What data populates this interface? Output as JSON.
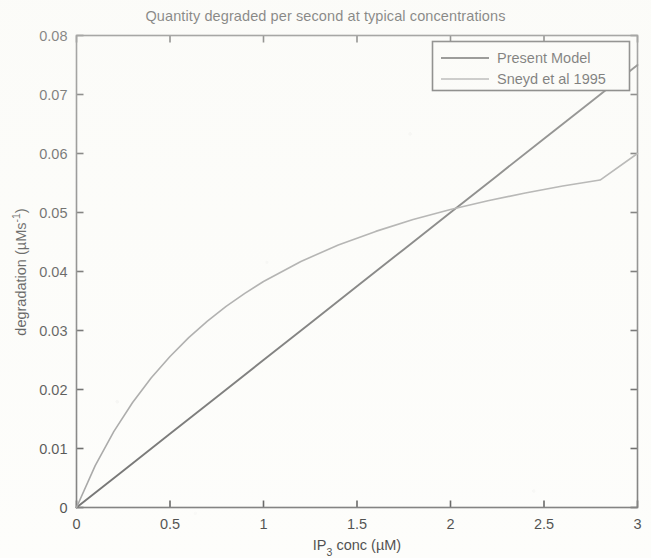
{
  "chart_data": {
    "type": "line",
    "title": "Quantity degraded per second at typical concentrations",
    "xlabel": "IP_3 conc (µM)",
    "xlabel_base": "IP",
    "xlabel_sub": "3",
    "xlabel_rest": " conc (µM)",
    "ylabel": "degradation (µMs⁻¹)",
    "ylabel_base": "degradation (µMs",
    "ylabel_sup": "-1",
    "ylabel_rest": ")",
    "xlim": [
      0,
      3
    ],
    "ylim": [
      0,
      0.08
    ],
    "xticks": [
      0,
      0.5,
      1,
      1.5,
      2,
      2.5,
      3
    ],
    "xticklabels": [
      "0",
      "0.5",
      "1",
      "1.5",
      "2",
      "2.5",
      "3"
    ],
    "yticks": [
      0,
      0.01,
      0.02,
      0.03,
      0.04,
      0.05,
      0.06,
      0.07,
      0.08
    ],
    "yticklabels": [
      "0",
      "0.01",
      "0.02",
      "0.03",
      "0.04",
      "0.05",
      "0.06",
      "0.07",
      "0.08"
    ],
    "grid": false,
    "legend_position": "upper right",
    "series": [
      {
        "name": "Present Model",
        "color": "#4a4a4a",
        "x": [
          0,
          0.25,
          0.5,
          0.75,
          1,
          1.25,
          1.5,
          1.75,
          2,
          2.25,
          2.5,
          2.75,
          3
        ],
        "values": [
          0,
          0.00625,
          0.0125,
          0.01875,
          0.025,
          0.03125,
          0.0375,
          0.04375,
          0.05,
          0.05625,
          0.0625,
          0.06875,
          0.075
        ]
      },
      {
        "name": "Sneyd et al 1995",
        "color": "#8d8d8d",
        "x": [
          0,
          0.1,
          0.2,
          0.3,
          0.4,
          0.5,
          0.6,
          0.7,
          0.8,
          0.9,
          1.0,
          1.2,
          1.4,
          1.6,
          1.8,
          2.0,
          2.2,
          2.4,
          2.6,
          2.8,
          3.0
        ],
        "values": [
          0,
          0.0071,
          0.0129,
          0.0178,
          0.022,
          0.0256,
          0.0288,
          0.0316,
          0.0341,
          0.0363,
          0.0383,
          0.0417,
          0.0445,
          0.0468,
          0.0488,
          0.0505,
          0.052,
          0.0533,
          0.0545,
          0.0555,
          0.06
        ]
      }
    ],
    "annotations": {
      "crossover_x": 2.2,
      "crossover_y": 0.055
    }
  },
  "legend": {
    "entries": [
      {
        "label": "Present Model"
      },
      {
        "label": "Sneyd et al 1995"
      }
    ]
  }
}
